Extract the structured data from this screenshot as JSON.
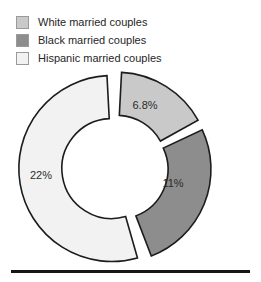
{
  "legend": {
    "position": "top-left",
    "items": [
      {
        "label": "White married couples",
        "color": "#c9c9c9",
        "swatch_name": "legend-swatch-white-married-couples"
      },
      {
        "label": "Black married couples",
        "color": "#8d8d8d",
        "swatch_name": "legend-swatch-black-married-couples"
      },
      {
        "label": "Hispanic married couples",
        "color": "#f2f2f2",
        "swatch_name": "legend-swatch-hispanic-married-couples"
      }
    ]
  },
  "chart_data": {
    "type": "pie",
    "variant": "donut-exploded",
    "title": "",
    "subtitle": "",
    "xlabel": "",
    "ylabel": "",
    "grid": false,
    "legend_position": "top-left",
    "categories": [
      "White married couples",
      "Black married couples",
      "Hispanic married couples"
    ],
    "values": [
      6.8,
      11,
      22
    ],
    "value_labels": [
      "6.8%",
      "11%",
      "22%"
    ],
    "unit": "%",
    "colors": [
      "#c9c9c9",
      "#8d8d8d",
      "#f2f2f2"
    ],
    "slices": [
      {
        "name": "White married couples",
        "value": 6.8,
        "label": "6.8%",
        "color": "#c9c9c9",
        "start_angle": 3,
        "end_angle": 61,
        "label_x": 145,
        "label_y": 38
      },
      {
        "name": "Black married couples",
        "value": 11,
        "label": "11%",
        "color": "#8d8d8d",
        "start_angle": 65,
        "end_angle": 159,
        "label_x": 173,
        "label_y": 116
      },
      {
        "name": "Hispanic married couples",
        "value": 22,
        "label": "22%",
        "color": "#f2f2f2",
        "start_angle": 164,
        "end_angle": 357,
        "label_x": 41,
        "label_y": 108
      }
    ],
    "geometry": {
      "center_x": 115,
      "center_y": 100,
      "outer_radius": 93,
      "inner_radius": 50
    }
  },
  "decorations": {
    "bottom_rule": "horizontal-rule"
  }
}
